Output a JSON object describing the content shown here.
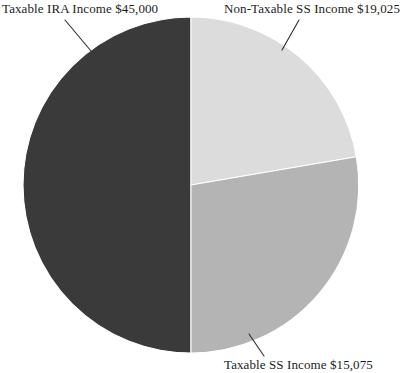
{
  "chart_data": {
    "type": "pie",
    "title": "",
    "subtitle": "",
    "xlabel": "",
    "ylabel": "",
    "grid": false,
    "legend_position": "callout-labels",
    "categories": [
      "Taxable IRA Income",
      "Non-Taxable SS Income",
      "Taxable SS Income"
    ],
    "values": [
      45000,
      19025,
      15075
    ],
    "value_labels": [
      "$45,000",
      "$19,025",
      "$15,075"
    ],
    "annotations": [
      "Taxable IRA Income $45,000",
      "Non-Taxable SS Income $19,025",
      "Taxable SS Income $15,075"
    ],
    "slices": [
      {
        "name": "Taxable IRA Income",
        "value": 45000,
        "value_label": "$45,000",
        "label": "Taxable IRA Income $45,000",
        "color": "#3a3a3a",
        "start_angle_deg": 180,
        "end_angle_deg": 360,
        "sweep_deg": 180,
        "percent": 56.9
      },
      {
        "name": "Non-Taxable SS Income",
        "value": 19025,
        "value_label": "$19,025",
        "label": "Non-Taxable SS Income $19,025",
        "color": "#dcdcdc",
        "start_angle_deg": 0,
        "end_angle_deg": 100,
        "sweep_deg": 100,
        "percent": 24.1
      },
      {
        "name": "Taxable SS Income",
        "value": 15075,
        "value_label": "$15,075",
        "label": "Taxable SS Income $15,075",
        "color": "#b4b4b4",
        "start_angle_deg": 100,
        "end_angle_deg": 180,
        "sweep_deg": 80,
        "percent": 19.1
      }
    ],
    "total": 79100,
    "colors": {
      "taxable_ira": "#3a3a3a",
      "non_taxable_ss": "#dcdcdc",
      "taxable_ss": "#b4b4b4",
      "background": "#ffffff",
      "label_text": "#1c1c1c",
      "leader_line": "#2b2b2b"
    },
    "geometry": {
      "center_x": 191,
      "center_y": 185,
      "radius": 168
    }
  },
  "labels": {
    "taxable_ira": "Taxable IRA Income $45,000",
    "non_taxable_ss": "Non-Taxable SS Income $19,025",
    "taxable_ss": "Taxable SS Income $15,075"
  }
}
